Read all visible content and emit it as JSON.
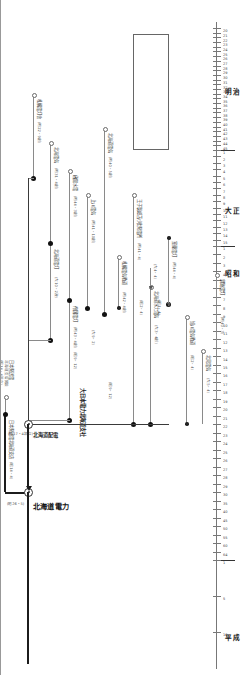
{
  "document": {
    "kind": "corporate-lineage-chart",
    "orientation": "rotated-90"
  },
  "eras": [
    {
      "name": "明治",
      "start_px": 28,
      "end_px": 150,
      "ticks": [
        "20",
        "21",
        "22",
        "23",
        "24",
        "25",
        "26",
        "27",
        "28",
        "29",
        "30",
        "31",
        "32",
        "33",
        "34",
        "35",
        "36",
        "37",
        "38",
        "39",
        "40",
        "41",
        "42",
        "43",
        "44",
        "45"
      ]
    },
    {
      "name": "大正",
      "start_px": 150,
      "end_px": 246,
      "ticks": [
        "1",
        "2",
        "3",
        "4",
        "5",
        "6",
        "7",
        "8",
        "9",
        "10",
        "11",
        "12",
        "13",
        "14",
        "15"
      ]
    },
    {
      "name": "昭和",
      "start_px": 246,
      "end_px": 560,
      "ticks": [
        "1",
        "2",
        "3",
        "4",
        "5",
        "6",
        "7",
        "8",
        "9",
        "10",
        "11",
        "12",
        "13",
        "14",
        "15",
        "16",
        "17",
        "18",
        "19",
        "20",
        "21",
        "22",
        "23",
        "24",
        "25",
        "26",
        "27",
        "28",
        "29",
        "30",
        "35",
        "40",
        "45",
        "50",
        "55",
        "60",
        "64"
      ]
    },
    {
      "name": "平成",
      "start_px": 560,
      "end_px": 668,
      "ticks": [
        "1",
        "5",
        "10"
      ]
    }
  ],
  "main_line": {
    "label": "北海道電力",
    "sublabel": "(昭26・5)",
    "name_ja": "北海道電力"
  },
  "nodes": [
    {
      "id": "merge-haiden",
      "label": "北海道配電",
      "sublabel": "(昭17・4設立)"
    },
    {
      "id": "merge-hokuden",
      "label": "北海道電力",
      "sublabel": "(昭26・5)"
    }
  ],
  "branches": [
    {
      "id": "b1",
      "label": "札幌電灯舎",
      "period": "(明22・9創)",
      "note": ""
    },
    {
      "id": "b2",
      "label": "北海電気",
      "period": "(明31・4創)",
      "note": ""
    },
    {
      "id": "b3",
      "label": "北海道電灯",
      "period": "(大10・2改)",
      "note": ""
    },
    {
      "id": "b4",
      "label": "函館水電",
      "period": "(明44・3創)",
      "note": ""
    },
    {
      "id": "b5",
      "label": "帝国電灯",
      "period": "(明43・4創)",
      "note": ""
    },
    {
      "id": "b6",
      "label": "大日本電力北海道支社",
      "period": "(昭9・12)",
      "note": ""
    },
    {
      "id": "b7",
      "label": "上川電気",
      "period": "(明41・10創)",
      "note": ""
    },
    {
      "id": "b8",
      "label": "北海水力電気",
      "period": "(大4・12創)",
      "note": ""
    },
    {
      "id": "b9",
      "label": "北海道電気",
      "period": "(明40・5創)",
      "note": ""
    },
    {
      "id": "b10",
      "label": "王子製紙苫小牧発電所",
      "period": "(明41・4)",
      "note": ""
    },
    {
      "id": "b11",
      "label": "札幌電気軌道",
      "period": "(明42・4創)",
      "note": ""
    },
    {
      "id": "b12",
      "label": "北海道水力電気",
      "period": "(大3・4創)",
      "note": ""
    },
    {
      "id": "b13",
      "label": "日本発送電",
      "period": "(昭14・4設立)",
      "note": "北海道支店開設"
    },
    {
      "id": "b14",
      "label": "日本発送電北海道支店",
      "period": "(昭14・4)",
      "note": ""
    },
    {
      "id": "b15",
      "label": "室蘭電灯",
      "period": "(明44・4)",
      "note": ""
    },
    {
      "id": "b16",
      "label": "旭川電気軌道",
      "period": "(昭2・4)",
      "note": ""
    },
    {
      "id": "b17",
      "label": "北見電気",
      "period": "(大5・4)",
      "note": ""
    },
    {
      "id": "b18",
      "label": "釧路電灯",
      "period": "(明40・3)",
      "note": ""
    }
  ],
  "small_notes": [
    "(昭1・4)",
    "(昭2・4)",
    "(大9・2)",
    "(昭9・12)",
    "(大4・4)",
    "(大5・4)",
    "(昭17・4設立)",
    "(昭26・5)",
    "(昭14・4)"
  ],
  "colors": {
    "line": "#8a8a8a",
    "main_line": "#1c1c1c",
    "text": "#333333",
    "axis": "#777777"
  }
}
